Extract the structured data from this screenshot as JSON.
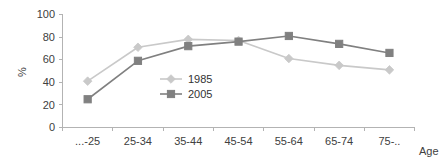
{
  "chart_data": {
    "type": "line",
    "title": "",
    "subtitle": "",
    "xlabel": "Age",
    "ylabel": "%",
    "ylim": [
      0,
      100
    ],
    "yticks": [
      0,
      20,
      40,
      60,
      80,
      100
    ],
    "grid": false,
    "legend_position": "inside-center-left",
    "categories": [
      "...-25",
      "25-34",
      "35-44",
      "45-54",
      "55-64",
      "65-74",
      "75-.."
    ],
    "series": [
      {
        "name": "1985",
        "color": "#c9c9c9",
        "marker": "diamond",
        "values": [
          41,
          71,
          78,
          77,
          61,
          55,
          51
        ]
      },
      {
        "name": "2005",
        "color": "#808080",
        "marker": "square",
        "values": [
          25,
          59,
          72,
          76,
          81,
          74,
          66
        ]
      }
    ]
  },
  "axis": {
    "y_tick_0": "0",
    "y_tick_1": "20",
    "y_tick_2": "40",
    "y_tick_3": "60",
    "y_tick_4": "80",
    "y_tick_5": "100",
    "y_title": "%",
    "x_title": "Age",
    "x_tick_0": "...-25",
    "x_tick_1": "25-34",
    "x_tick_2": "35-44",
    "x_tick_3": "45-54",
    "x_tick_4": "55-64",
    "x_tick_5": "65-74",
    "x_tick_6": "75-.."
  },
  "legend": {
    "entry_0_label": "1985",
    "entry_1_label": "2005"
  },
  "colors": {
    "series_1985": "#c9c9c9",
    "series_2005": "#808080",
    "axis": "#b3b3b3",
    "text": "#404040",
    "background": "#ffffff"
  }
}
